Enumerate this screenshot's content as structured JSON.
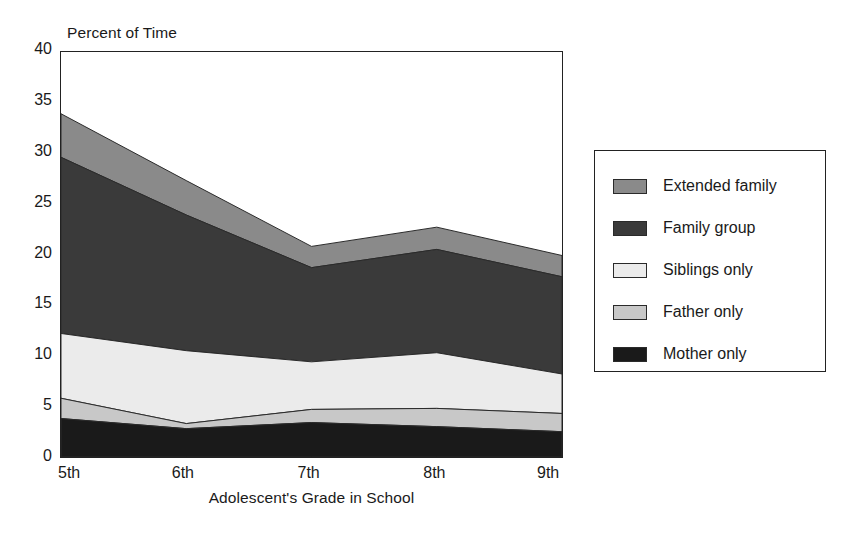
{
  "chart_data": {
    "type": "area",
    "stacked": true,
    "title": "",
    "xlabel": "Adolescent's Grade in School",
    "ylabel": "Percent of Time",
    "categories": [
      "5th",
      "6th",
      "7th",
      "8th",
      "9th"
    ],
    "x_tick_labels": [
      "5th",
      "6th",
      "7th",
      "8th",
      "9th"
    ],
    "y_tick_labels": [
      "0",
      "5",
      "10",
      "15",
      "20",
      "25",
      "30",
      "35",
      "40"
    ],
    "y_ticks": [
      0,
      5,
      10,
      15,
      20,
      25,
      30,
      35,
      40
    ],
    "ylim": [
      0,
      40
    ],
    "grid": false,
    "legend_position": "right-outside",
    "series": [
      {
        "name": "Mother only",
        "color": "#1a1a1a",
        "values": [
          3.8,
          2.8,
          3.4,
          3.0,
          2.5
        ]
      },
      {
        "name": "Father only",
        "color": "#c8c8c8",
        "values": [
          2.0,
          0.5,
          1.3,
          1.8,
          1.8
        ]
      },
      {
        "name": "Siblings only",
        "color": "#ebebeb",
        "values": [
          6.4,
          7.2,
          4.7,
          5.5,
          3.9
        ]
      },
      {
        "name": "Family group",
        "color": "#3a3a3a",
        "values": [
          17.4,
          13.4,
          9.3,
          10.2,
          9.6
        ]
      },
      {
        "name": "Extended family",
        "color": "#8a8a8a",
        "values": [
          4.3,
          3.4,
          2.1,
          2.2,
          2.1
        ]
      }
    ],
    "cumulative_tops": {
      "Mother only": [
        3.8,
        2.8,
        3.4,
        3.0,
        2.5
      ],
      "Father only": [
        5.8,
        3.3,
        4.7,
        4.8,
        4.3
      ],
      "Siblings only": [
        12.2,
        10.5,
        9.4,
        10.3,
        8.2
      ],
      "Family group": [
        29.6,
        23.9,
        18.7,
        20.5,
        17.8
      ],
      "Extended family": [
        33.9,
        27.3,
        20.8,
        22.7,
        19.9
      ]
    }
  },
  "legend": {
    "entries": [
      {
        "label": "Extended family",
        "color": "#8a8a8a"
      },
      {
        "label": "Family group",
        "color": "#3a3a3a"
      },
      {
        "label": "Siblings only",
        "color": "#ebebeb"
      },
      {
        "label": "Father only",
        "color": "#c8c8c8"
      },
      {
        "label": "Mother only",
        "color": "#1a1a1a"
      }
    ]
  },
  "colors": {
    "axis": "#222222",
    "text": "#1a1a1a",
    "background": "#ffffff"
  }
}
